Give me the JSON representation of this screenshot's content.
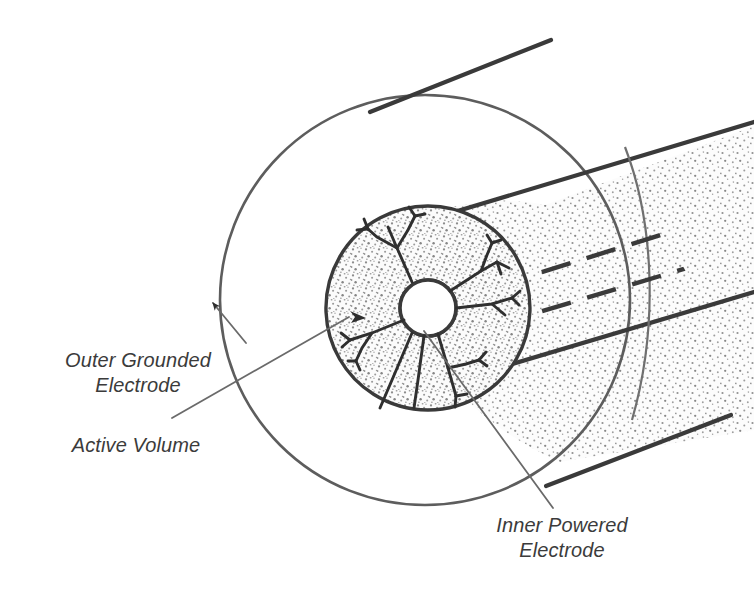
{
  "figure": {
    "background_color": "#ffffff",
    "ink_color": "#3b3b3b",
    "line_color_dark": "#3a3a3a",
    "line_color_light": "#7a7a7a",
    "stipple_color": "#8d8d8d",
    "stipple_fill": "#fbfbfb"
  },
  "labels": {
    "outer_electrode": "Outer Grounded\nElectrode",
    "active_volume": "Active Volume",
    "inner_electrode": "Inner Powered\nElectrode"
  },
  "geometry": {
    "outer_circle": {
      "cx": 425,
      "cy": 300,
      "r": 205
    },
    "stippled_disc": {
      "cx": 428,
      "cy": 308,
      "r": 102
    },
    "inner_circle": {
      "cx": 428,
      "cy": 308,
      "r": 28
    },
    "tube_axis_angle_deg": -21,
    "dashed_hidden_lines": 2,
    "streamer_branches": 6
  },
  "leaders": {
    "outer_electrode": {
      "from_x": 243,
      "from_y": 341,
      "to_x": 211,
      "to_y": 302,
      "arrow": true
    },
    "active_volume": {
      "from_x": 176,
      "from_y": 415,
      "to_x": 364,
      "to_y": 316,
      "arrow": true
    },
    "inner_electrode": {
      "from_x": 551,
      "from_y": 505,
      "to_x": 425,
      "to_y": 333,
      "arrow": false
    }
  }
}
